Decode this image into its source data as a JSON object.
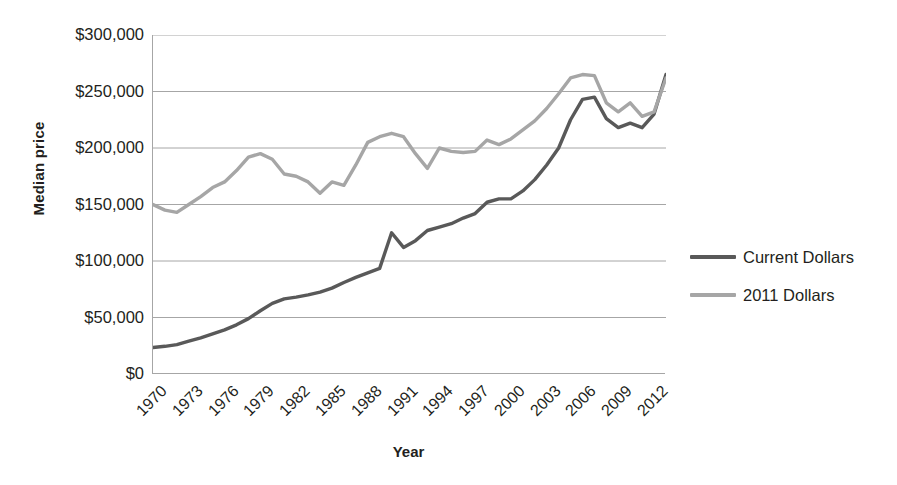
{
  "chart_data": {
    "type": "line",
    "title": "",
    "xlabel": "Year",
    "ylabel": "Median price",
    "ylim": [
      0,
      300000
    ],
    "xlim": [
      1970,
      2013
    ],
    "grid": true,
    "legend_position": "right",
    "y_ticks": [
      "$300,000",
      "$250,000",
      "$200,000",
      "$150,000",
      "$100,000",
      "$50,000",
      "$0"
    ],
    "y_tick_values": [
      300000,
      250000,
      200000,
      150000,
      100000,
      50000,
      0
    ],
    "x_ticks": [
      "1970",
      "1973",
      "1976",
      "1979",
      "1982",
      "1985",
      "1988",
      "1991",
      "1994",
      "1997",
      "2000",
      "2003",
      "2006",
      "2009",
      "2012"
    ],
    "x_tick_values": [
      1970,
      1973,
      1976,
      1979,
      1982,
      1985,
      1988,
      1991,
      1994,
      1997,
      2000,
      2003,
      2006,
      2009,
      2012
    ],
    "x": [
      1970,
      1971,
      1972,
      1973,
      1974,
      1975,
      1976,
      1977,
      1978,
      1979,
      1980,
      1981,
      1982,
      1983,
      1984,
      1985,
      1986,
      1987,
      1988,
      1989,
      1990,
      1991,
      1992,
      1993,
      1994,
      1995,
      1996,
      1997,
      1998,
      1999,
      2000,
      2001,
      2002,
      2003,
      2004,
      2005,
      2006,
      2007,
      2008,
      2009,
      2010,
      2011,
      2012,
      2013
    ],
    "series": [
      {
        "name": "Current Dollars",
        "color": "#595959",
        "values": [
          23400,
          24800,
          26700,
          28900,
          32000,
          35300,
          38100,
          42900,
          48700,
          55700,
          62200,
          66400,
          67800,
          70300,
          72400,
          75500,
          80300,
          85600,
          89300,
          93100,
          95500,
          100300,
          103700,
          106800,
          109800,
          113100,
          118200,
          124100,
          128400,
          133300,
          139000,
          147800,
          158100,
          170000,
          185200,
          219600,
          221900,
          217900,
          198100,
          172100,
          173100,
          166200,
          177200,
          197400
        ]
      },
      {
        "name": "2011 Dollars",
        "color": "#a6a6a6",
        "values": [
          150000,
          145200,
          143100,
          148600,
          152300,
          158800,
          167000,
          176500,
          188200,
          195000,
          193500,
          178800,
          163600,
          161800,
          159600,
          161500,
          168300,
          174500,
          176100,
          177900,
          176800,
          173900,
          171400,
          173200,
          180900,
          181100,
          177300,
          178700,
          181100,
          184200,
          186300,
          190700,
          196400,
          203200,
          212600,
          240700,
          244300,
          236100,
          209700,
          181800,
          180600,
          172900,
          181700,
          198700
        ]
      }
    ],
    "series_display": [
      {
        "name": "Current Dollars",
        "color": "#595959",
        "points": [
          [
            1970,
            23500
          ],
          [
            1971,
            24500
          ],
          [
            1972,
            26000
          ],
          [
            1973,
            29000
          ],
          [
            1974,
            32000
          ],
          [
            1975,
            35500
          ],
          [
            1976,
            39000
          ],
          [
            1977,
            43500
          ],
          [
            1978,
            49000
          ],
          [
            1979,
            56000
          ],
          [
            1980,
            62500
          ],
          [
            1981,
            66500
          ],
          [
            1982,
            68000
          ],
          [
            1983,
            70000
          ],
          [
            1984,
            72500
          ],
          [
            1985,
            76000
          ],
          [
            1986,
            81000
          ],
          [
            1987,
            85500
          ],
          [
            1988,
            89500
          ],
          [
            1989,
            93500
          ],
          [
            1990,
            125000
          ],
          [
            1991,
            112000
          ],
          [
            1992,
            118000
          ],
          [
            1993,
            127000
          ],
          [
            1994,
            130000
          ],
          [
            1995,
            133000
          ],
          [
            1996,
            138000
          ],
          [
            1997,
            142000
          ],
          [
            1998,
            152000
          ],
          [
            1999,
            155000
          ],
          [
            2000,
            155000
          ],
          [
            2001,
            162000
          ],
          [
            2002,
            172000
          ],
          [
            2003,
            185000
          ],
          [
            2004,
            200000
          ],
          [
            2005,
            225000
          ],
          [
            2006,
            243000
          ],
          [
            2007,
            245000
          ],
          [
            2008,
            226000
          ],
          [
            2009,
            218000
          ],
          [
            2010,
            222000
          ],
          [
            2011,
            218000
          ],
          [
            2012,
            230000
          ],
          [
            2013,
            265000
          ]
        ]
      },
      {
        "name": "2011 Dollars",
        "color": "#a6a6a6",
        "points": [
          [
            1970,
            150000
          ],
          [
            1971,
            145000
          ],
          [
            1972,
            143000
          ],
          [
            1973,
            150000
          ],
          [
            1974,
            157000
          ],
          [
            1975,
            165000
          ],
          [
            1976,
            170000
          ],
          [
            1977,
            180000
          ],
          [
            1978,
            192000
          ],
          [
            1979,
            195000
          ],
          [
            1980,
            190000
          ],
          [
            1981,
            177000
          ],
          [
            1982,
            175000
          ],
          [
            1983,
            170000
          ],
          [
            1984,
            160000
          ],
          [
            1985,
            170000
          ],
          [
            1986,
            167000
          ],
          [
            1987,
            185000
          ],
          [
            1988,
            205000
          ],
          [
            1989,
            210000
          ],
          [
            1990,
            213000
          ],
          [
            1991,
            210000
          ],
          [
            1992,
            195000
          ],
          [
            1993,
            182000
          ],
          [
            1994,
            200000
          ],
          [
            1995,
            197000
          ],
          [
            1996,
            196000
          ],
          [
            1997,
            197000
          ],
          [
            1998,
            207000
          ],
          [
            1999,
            203000
          ],
          [
            2000,
            208000
          ],
          [
            2001,
            216000
          ],
          [
            2002,
            224000
          ],
          [
            2003,
            235000
          ],
          [
            2004,
            248000
          ],
          [
            2005,
            262000
          ],
          [
            2006,
            265000
          ],
          [
            2007,
            264000
          ],
          [
            2008,
            240000
          ],
          [
            2009,
            232000
          ],
          [
            2010,
            240000
          ],
          [
            2011,
            228000
          ],
          [
            2012,
            232000
          ],
          [
            2013,
            262000
          ]
        ]
      }
    ]
  },
  "axis": {
    "y_title": "Median price",
    "x_title": "Year"
  },
  "legend": {
    "items": [
      {
        "label": "Current Dollars",
        "color": "#595959"
      },
      {
        "label": "2011 Dollars",
        "color": "#a6a6a6"
      }
    ]
  },
  "colors": {
    "current_dollars": "#595959",
    "dollars_2011": "#a6a6a6",
    "gridline": "#a6a6a6",
    "text": "#231f20",
    "background": "#ffffff"
  }
}
